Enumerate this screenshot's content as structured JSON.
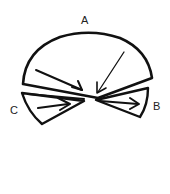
{
  "diagram": {
    "labels": {
      "a": "A",
      "b": "B",
      "c": "C"
    },
    "regions": [
      {
        "id": "A",
        "shape": "large-sector",
        "position": "top"
      },
      {
        "id": "B",
        "shape": "small-sector",
        "position": "right"
      },
      {
        "id": "C",
        "shape": "small-sector",
        "position": "left"
      }
    ],
    "arrows": [
      {
        "region": "A",
        "direction": "toward-center"
      },
      {
        "region": "A",
        "direction": "toward-center-from-top"
      },
      {
        "region": "B",
        "direction": "outward-right"
      },
      {
        "region": "C",
        "direction": "toward-center"
      }
    ],
    "colors": {
      "stroke": "#111111",
      "background": "#ffffff"
    }
  }
}
